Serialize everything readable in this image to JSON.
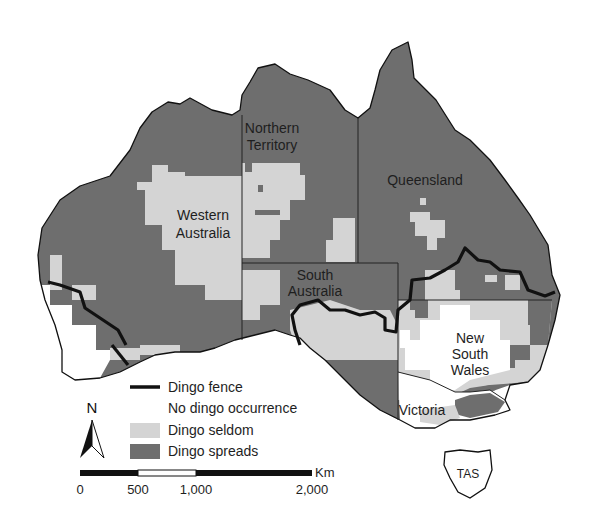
{
  "map": {
    "title": "Dingo distribution in Australia",
    "colors": {
      "spreads": "#6e6e6e",
      "seldom": "#d4d4d4",
      "none": "#ffffff",
      "fence": "#111111",
      "border": "#222222"
    },
    "regions": {
      "wa": [
        "Western",
        "Australia"
      ],
      "nt": [
        "Northern",
        "Territory"
      ],
      "qld": [
        "Queensland"
      ],
      "sa": [
        "South",
        "Australia"
      ],
      "nsw": [
        "New",
        "South",
        "Wales"
      ],
      "vic": [
        "Victoria"
      ],
      "tas": [
        "TAS"
      ]
    }
  },
  "legend": {
    "items": [
      {
        "key": "fence",
        "label": "Dingo fence"
      },
      {
        "key": "none",
        "label": "No dingo occurrence"
      },
      {
        "key": "seldom",
        "label": "Dingo seldom"
      },
      {
        "key": "spreads",
        "label": "Dingo spreads"
      }
    ]
  },
  "north_arrow": {
    "label": "N"
  },
  "scale_bar": {
    "unit": "Km",
    "ticks": [
      "0",
      "500",
      "1,000",
      "2,000"
    ]
  }
}
